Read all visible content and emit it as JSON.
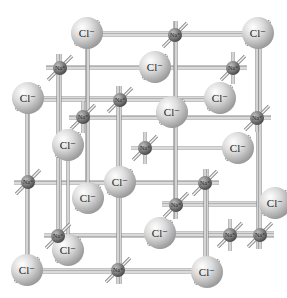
{
  "diagram": {
    "type": "ionic crystal lattice (rock salt)",
    "labels": {
      "chloride": "Cl⁻",
      "sodium": "Na⁺"
    },
    "colors": {
      "chloride_sphere": "#c8c8c8",
      "sodium_sphere": "#6f6f6f",
      "rod": "#8a8a8a",
      "background": "#ffffff"
    },
    "chloride_ions": [
      {
        "x": 87,
        "y": 33
      },
      {
        "x": 258,
        "y": 33
      },
      {
        "x": 155,
        "y": 67
      },
      {
        "x": 28,
        "y": 98
      },
      {
        "x": 220,
        "y": 98
      },
      {
        "x": 172,
        "y": 112
      },
      {
        "x": 68,
        "y": 145
      },
      {
        "x": 238,
        "y": 148
      },
      {
        "x": 120,
        "y": 182
      },
      {
        "x": 88,
        "y": 198
      },
      {
        "x": 275,
        "y": 203
      },
      {
        "x": 160,
        "y": 233
      },
      {
        "x": 27,
        "y": 270
      },
      {
        "x": 207,
        "y": 272
      },
      {
        "x": 68,
        "y": 250
      }
    ],
    "sodium_ions": [
      {
        "x": 60,
        "y": 68
      },
      {
        "x": 120,
        "y": 100
      },
      {
        "x": 233,
        "y": 68
      },
      {
        "x": 175,
        "y": 35
      },
      {
        "x": 83,
        "y": 117
      },
      {
        "x": 257,
        "y": 118
      },
      {
        "x": 28,
        "y": 182
      },
      {
        "x": 145,
        "y": 148
      },
      {
        "x": 205,
        "y": 183
      },
      {
        "x": 58,
        "y": 236
      },
      {
        "x": 118,
        "y": 270
      },
      {
        "x": 230,
        "y": 235
      },
      {
        "x": 260,
        "y": 235
      },
      {
        "x": 176,
        "y": 205
      }
    ]
  }
}
